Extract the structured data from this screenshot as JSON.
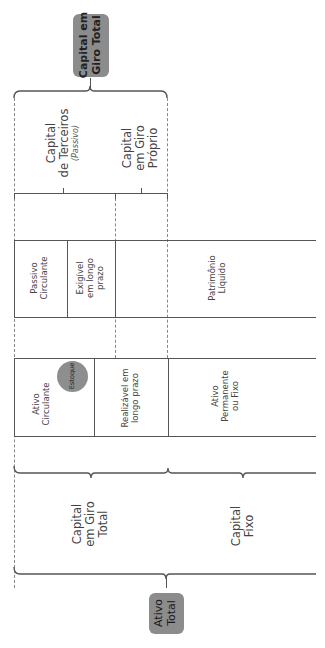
{
  "diagram": {
    "orientation": "rotated-90-ccw",
    "top_badge": {
      "line1": "Capital em",
      "line2": "Giro Total"
    },
    "top_bracket": {
      "left": {
        "line1": "Capital",
        "line2": "de Terceiros",
        "line3": "(Passivo)"
      },
      "right": {
        "line1": "Capital",
        "line2": "em Giro",
        "line3": "Próprio"
      }
    },
    "passivo_row": {
      "cells": [
        {
          "line1": "Passivo",
          "line2": "Circulante"
        },
        {
          "line1": "Exigível",
          "line2": "em longo",
          "line3": "prazo"
        },
        {
          "line1": "Patrimônio",
          "line2": "Líquido"
        }
      ]
    },
    "ativo_row": {
      "cells": [
        {
          "line1": "Ativo",
          "line2": "Circulante"
        },
        {
          "line1": "Realizável em",
          "line2": "longo prazo"
        },
        {
          "line1": "Ativo",
          "line2": "Permanente",
          "line3": "ou Fixo"
        }
      ],
      "estoque_label": "Estoque"
    },
    "bottom_bracket": {
      "left": {
        "line1": "Capital",
        "line2": "em Giro",
        "line3": "Total"
      },
      "right": {
        "line1": "Capital",
        "line2": "Fixo"
      }
    },
    "bottom_badge": {
      "line1": "Ativo",
      "line2": "Total"
    },
    "colors": {
      "badge": "#8c8c8c",
      "line": "#555555",
      "dash": "#888888",
      "circle": "#8e8e8e"
    }
  }
}
